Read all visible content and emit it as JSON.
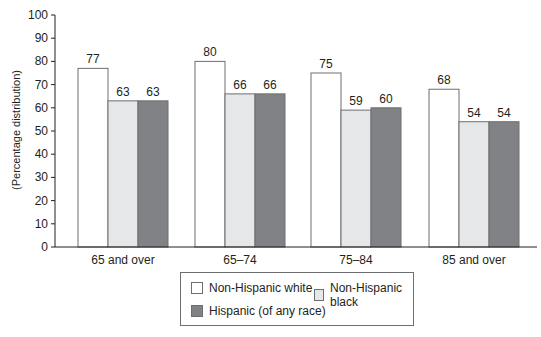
{
  "chart_data": {
    "type": "bar",
    "title": "",
    "xlabel": "",
    "ylabel": "(Percentage distribution)",
    "ylim": [
      0,
      100
    ],
    "yticks": [
      0,
      10,
      20,
      30,
      40,
      50,
      60,
      70,
      80,
      90,
      100
    ],
    "grid": false,
    "legend_position": "bottom",
    "categories": [
      "65 and over",
      "65–74",
      "75–84",
      "85 and over"
    ],
    "series": [
      {
        "name": "Non-Hispanic white",
        "color": "#ffffff",
        "values": [
          77,
          80,
          75,
          68
        ]
      },
      {
        "name": "Non-Hispanic black",
        "color": "#e6e7e8",
        "values": [
          63,
          66,
          59,
          54
        ]
      },
      {
        "name": "Hispanic (of any race)",
        "color": "#808285",
        "values": [
          63,
          66,
          60,
          54
        ]
      }
    ]
  },
  "legend": {
    "items": [
      "Non-Hispanic white",
      "Non-Hispanic black",
      "Hispanic (of any race)"
    ]
  }
}
